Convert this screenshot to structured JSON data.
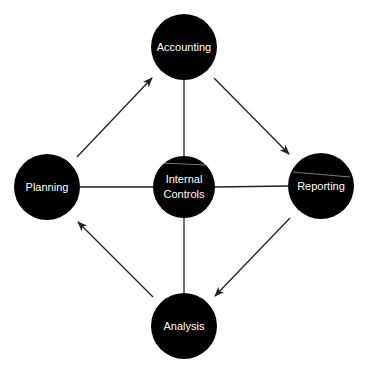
{
  "diagram": {
    "center": {
      "id": "internal-controls",
      "line1": "Internal",
      "line2": "Controls"
    },
    "nodes": {
      "accounting": {
        "label": "Accounting"
      },
      "reporting": {
        "label": "Reporting"
      },
      "analysis": {
        "label": "Analysis"
      },
      "planning": {
        "label": "Planning"
      }
    },
    "cycle": [
      "Planning",
      "Accounting",
      "Reporting",
      "Analysis",
      "Planning"
    ],
    "colors": {
      "node_fill": "#000000",
      "text": "#ffffff",
      "lines": "#222222",
      "background": "#ffffff"
    }
  }
}
